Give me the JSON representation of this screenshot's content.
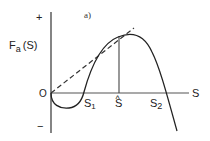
{
  "figure": {
    "panel_label": "a)",
    "y_axis_label": "F",
    "y_axis_label_sub": "a",
    "y_axis_label_arg": "(S)",
    "y_plus": "+",
    "y_minus": "−",
    "origin_label": "O",
    "x_axis_label": "S",
    "points": {
      "s1": {
        "main": "S",
        "sub": "1"
      },
      "s_hat": {
        "main": "S",
        "hat": "^"
      },
      "s2": {
        "main": "S",
        "sub": "2"
      }
    }
  }
}
